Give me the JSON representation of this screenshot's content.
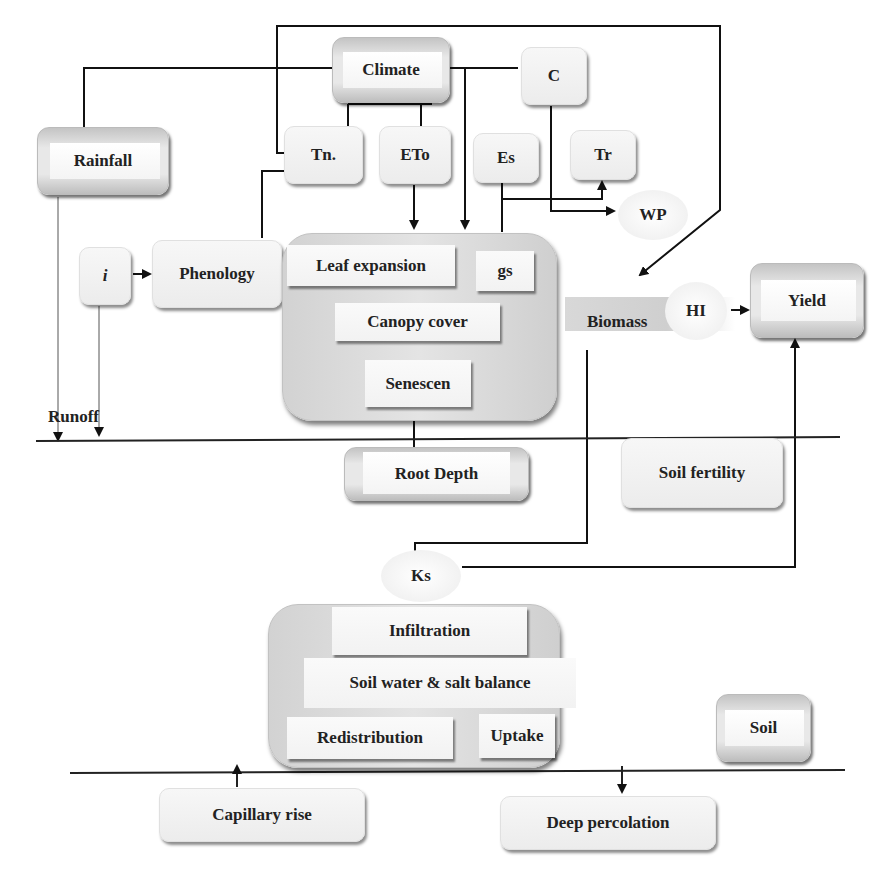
{
  "diagram": {
    "type": "flowchart",
    "nodes": {
      "climate": "Climate",
      "c": "C",
      "rainfall": "Rainfall",
      "tn": "Tn.",
      "eto": "ETo",
      "es": "Es",
      "tr": "Tr",
      "wp": "WP",
      "i": "i",
      "phenology": "Phenology",
      "leaf_expansion": "Leaf expansion",
      "gs": "gs",
      "canopy_cover": "Canopy cover",
      "senescence": "Senescen",
      "biomass": "Biomass",
      "hi": "HI",
      "yield": "Yield",
      "runoff": "Runoff",
      "root_depth": "Root Depth",
      "soil_fertility": "Soil fertility",
      "ks": "Ks",
      "infiltration": "Infiltration",
      "soil_water_salt_balance": "Soil water & salt balance",
      "redistribution": "Redistribution",
      "uptake": "Uptake",
      "soil": "Soil",
      "capillary_rise": "Capillary rise",
      "deep_percolation": "Deep percolation"
    },
    "edges": [
      {
        "from": "Climate",
        "to": "Rainfall",
        "arrow": false
      },
      {
        "from": "Climate",
        "to": "C",
        "arrow": false
      },
      {
        "from": "Climate",
        "to": "Tn.",
        "arrow": false
      },
      {
        "from": "Climate",
        "to": "ETo",
        "arrow": false
      },
      {
        "from": "Climate",
        "to": "Crop canopy",
        "arrow": true
      },
      {
        "from": "Tn.",
        "to": "Biomass",
        "arrow": true
      },
      {
        "from": "Tn.",
        "to": "Phenology",
        "arrow": false
      },
      {
        "from": "ETo",
        "to": "Crop canopy",
        "arrow": true
      },
      {
        "from": "Crop canopy",
        "to": "Es",
        "arrow": true
      },
      {
        "from": "Crop canopy",
        "to": "Tr",
        "arrow": true
      },
      {
        "from": "C",
        "to": "WP",
        "arrow": true
      },
      {
        "from": "i",
        "to": "Phenology",
        "arrow": true
      },
      {
        "from": "HI",
        "to": "Yield",
        "arrow": true
      },
      {
        "from": "Ks",
        "to": "Yield",
        "arrow": true
      },
      {
        "from": "Biomass",
        "to": "Ks",
        "arrow": false
      },
      {
        "from": "Crop canopy",
        "to": "Root Depth",
        "arrow": false
      },
      {
        "from": "Rainfall",
        "to": "Runoff",
        "arrow": true
      },
      {
        "from": "i",
        "to": "Runoff",
        "arrow": true
      },
      {
        "from": "Capillary rise",
        "to": "Soil water & salt balance",
        "arrow": true
      },
      {
        "from": "Soil water & salt balance",
        "to": "Deep percolation",
        "arrow": true
      }
    ]
  }
}
